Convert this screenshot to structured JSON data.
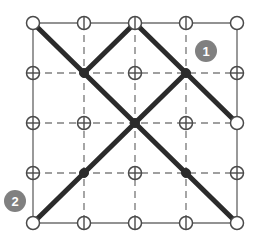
{
  "diagram": {
    "type": "node-link-grid",
    "canvas": {
      "width": 255,
      "height": 245
    },
    "colors": {
      "background": "#ffffff",
      "border_line": "#6e6e6e",
      "dashed_line": "#808080",
      "path_line": "#2b2b2b",
      "node_stroke": "#4a4a4a",
      "node_fill_open": "#ffffff",
      "node_fill_solid": "#2b2b2b",
      "badge_fill": "#808080",
      "badge_text": "#ffffff"
    },
    "geometry": {
      "origin_x": 33,
      "origin_y": 23,
      "step_x": 51,
      "step_y": 50,
      "columns": 5,
      "rows": 5,
      "node_radius": 6.5,
      "solid_node_radius": 4.5,
      "path_stroke_width": 5,
      "border_stroke_width": 1.4,
      "dash_stroke_width": 1.4,
      "dash_pattern": "7,5"
    },
    "nodes": [
      {
        "id": "r0c0",
        "col": 0,
        "row": 0,
        "style": "circle-plain"
      },
      {
        "id": "r0c1",
        "col": 1,
        "row": 0,
        "style": "circle-vline"
      },
      {
        "id": "r0c2",
        "col": 2,
        "row": 0,
        "style": "circle-vline"
      },
      {
        "id": "r0c3",
        "col": 3,
        "row": 0,
        "style": "circle-vline"
      },
      {
        "id": "r0c4",
        "col": 4,
        "row": 0,
        "style": "circle-plain"
      },
      {
        "id": "r1c0",
        "col": 0,
        "row": 1,
        "style": "circle-cross"
      },
      {
        "id": "r1c1",
        "col": 1,
        "row": 1,
        "style": "solid"
      },
      {
        "id": "r1c2",
        "col": 2,
        "row": 1,
        "style": "circle-cross"
      },
      {
        "id": "r1c3",
        "col": 3,
        "row": 1,
        "style": "solid"
      },
      {
        "id": "r1c4",
        "col": 4,
        "row": 1,
        "style": "circle-cross"
      },
      {
        "id": "r2c0",
        "col": 0,
        "row": 2,
        "style": "circle-cross"
      },
      {
        "id": "r2c1",
        "col": 1,
        "row": 2,
        "style": "circle-cross"
      },
      {
        "id": "r2c2",
        "col": 2,
        "row": 2,
        "style": "solid"
      },
      {
        "id": "r2c3",
        "col": 3,
        "row": 2,
        "style": "circle-cross"
      },
      {
        "id": "r2c4",
        "col": 4,
        "row": 2,
        "style": "circle-plain"
      },
      {
        "id": "r3c0",
        "col": 0,
        "row": 3,
        "style": "circle-cross"
      },
      {
        "id": "r3c1",
        "col": 1,
        "row": 3,
        "style": "solid"
      },
      {
        "id": "r3c2",
        "col": 2,
        "row": 3,
        "style": "circle-cross"
      },
      {
        "id": "r3c3",
        "col": 3,
        "row": 3,
        "style": "solid"
      },
      {
        "id": "r3c4",
        "col": 4,
        "row": 3,
        "style": "circle-cross"
      },
      {
        "id": "r4c0",
        "col": 0,
        "row": 4,
        "style": "circle-plain"
      },
      {
        "id": "r4c1",
        "col": 1,
        "row": 4,
        "style": "circle-vline"
      },
      {
        "id": "r4c2",
        "col": 2,
        "row": 4,
        "style": "circle-vline"
      },
      {
        "id": "r4c3",
        "col": 3,
        "row": 4,
        "style": "circle-vline"
      },
      {
        "id": "r4c4",
        "col": 4,
        "row": 4,
        "style": "circle-plain"
      }
    ],
    "border_lines": [
      {
        "id": "border-top",
        "from": [
          0,
          0
        ],
        "to": [
          4,
          0
        ]
      },
      {
        "id": "border-bottom",
        "from": [
          0,
          4
        ],
        "to": [
          4,
          4
        ]
      },
      {
        "id": "border-left",
        "from": [
          0,
          0
        ],
        "to": [
          0,
          4
        ]
      },
      {
        "id": "border-right",
        "from": [
          4,
          0
        ],
        "to": [
          4,
          4
        ]
      }
    ],
    "dashed_lines": [
      {
        "id": "dash-h-row1",
        "from": [
          0,
          1
        ],
        "to": [
          4,
          1
        ]
      },
      {
        "id": "dash-h-row2",
        "from": [
          0,
          2
        ],
        "to": [
          4,
          2
        ]
      },
      {
        "id": "dash-h-row3",
        "from": [
          0,
          3
        ],
        "to": [
          4,
          3
        ]
      },
      {
        "id": "dash-v-col1",
        "from": [
          1,
          0
        ],
        "to": [
          1,
          4
        ]
      },
      {
        "id": "dash-v-col2",
        "from": [
          2,
          0
        ],
        "to": [
          2,
          4
        ]
      },
      {
        "id": "dash-v-col3",
        "from": [
          3,
          0
        ],
        "to": [
          3,
          4
        ]
      }
    ],
    "paths": [
      {
        "id": "path-a",
        "points": [
          [
            0,
            0
          ],
          [
            2,
            2
          ],
          [
            4,
            4
          ]
        ]
      },
      {
        "id": "path-b",
        "points": [
          [
            0,
            4
          ],
          [
            2,
            2
          ],
          [
            3,
            1
          ],
          [
            4,
            2
          ]
        ]
      },
      {
        "id": "path-c",
        "points": [
          [
            1,
            1
          ],
          [
            2,
            0
          ],
          [
            3,
            1
          ]
        ]
      }
    ],
    "badges": [
      {
        "id": "badge-1",
        "label": "1",
        "col": 3,
        "row": 1,
        "dx": 20,
        "dy": -22,
        "radius": 11
      },
      {
        "id": "badge-2",
        "label": "2",
        "col": 0,
        "row": 4,
        "dx": -18,
        "dy": -22,
        "radius": 11
      }
    ]
  }
}
